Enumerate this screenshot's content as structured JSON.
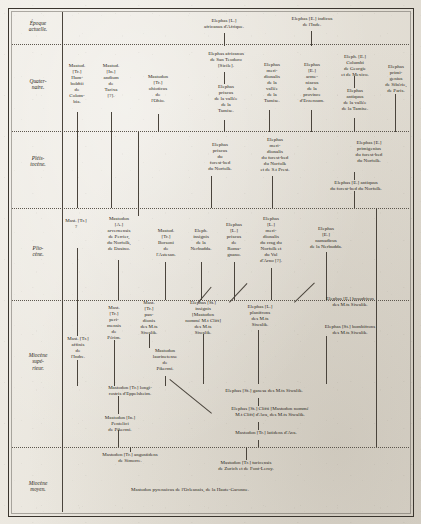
{
  "figure": {
    "language": "fr",
    "ink_color": "#2b2720",
    "paper_color": "#e8e5de"
  },
  "eras": [
    {
      "id": "epoque-actuelle",
      "label": "Époque\nactuelle."
    },
    {
      "id": "quaternaire",
      "label": "Quater-\nnaire."
    },
    {
      "id": "pleistocene",
      "label": "Pléis-\ntocène."
    },
    {
      "id": "pliocene",
      "label": "Plio-\ncène."
    },
    {
      "id": "miocene-superieur",
      "label": "Miocène\nsupé-\nrieur."
    },
    {
      "id": "miocene-moyen",
      "label": "Miocène\nmoyen."
    }
  ],
  "taxa": [
    {
      "id": "t01",
      "text": "Elephas [L.]\nafricanus d'Afrique."
    },
    {
      "id": "t02",
      "text": "Elephas [E.] indicus\nde l'Inde."
    },
    {
      "id": "t03",
      "text": "Mastod.\n[Tr.]\nHum-\nboldtii\nde\nColom-\nbia."
    },
    {
      "id": "t04",
      "text": "Mastod.\n[In.]\nandium\nde\nTarixa\n[?]."
    },
    {
      "id": "t05",
      "text": "Mastodon\n[Tr.]\nohioticus\nde\nl'Ohio."
    },
    {
      "id": "t06",
      "text": "Elephas africanus\nde San Teodoro\n[Sicile]."
    },
    {
      "id": "t07",
      "text": "Elephas\npriscus\nde la vallée\nde la\nTamise."
    },
    {
      "id": "t08",
      "text": "Elephas\nmeri-\ndionalis\nde la\nvallée\nde la\nTamise."
    },
    {
      "id": "t09",
      "text": "Elephas\n[E.]\narme-\nniacus\nde la\nprovince\nd'Erzeroum."
    },
    {
      "id": "t10",
      "text": "Eleph. [E.]\nColumbi\nde Georgie\net de Mexico."
    },
    {
      "id": "t11",
      "text": "Elephas\nantiquus\nde la vallée\nde la Tamise."
    },
    {
      "id": "t12",
      "text": "Elephas\nprimi-\ngenius\nde Sibérie,\nde Paris."
    },
    {
      "id": "t13",
      "text": "Elephas\npriscus\ndu\nforest-bed\ndu Norfolk."
    },
    {
      "id": "t14",
      "text": "Elephas\nmeri-\ndionalis\ndu forest-bed\ndu Norfolk\net de S.t Prest."
    },
    {
      "id": "t15",
      "text": "Elephas [E.]\nprimigenius\ndu forest-bed\ndu Norfolk."
    },
    {
      "id": "t16",
      "text": "Elephas [E.] antiquus\ndu forest-bed du Norfolk."
    },
    {
      "id": "t17",
      "text": "Mast. [Tr.]\n?"
    },
    {
      "id": "t18",
      "text": "Mastodon\n[A.]\narvernensis\nde Perrier,\ndu Norfolk,\nde Dusino."
    },
    {
      "id": "t19",
      "text": "Mastod.\n[Tr.]\nBorsoni\nde\nl'Astesan."
    },
    {
      "id": "t20",
      "text": "Eleph.\ninsignis\nde la\nNerbudda."
    },
    {
      "id": "t21",
      "text": "Elephas\n[L.]\npriscus\nde\nRoma-\ngnano."
    },
    {
      "id": "t22",
      "text": "Elephas\n[L.]\nmeri-\ndionalis\ndu crag du\nNorfolk et\ndu Val\nd'Arno [?]."
    },
    {
      "id": "t23",
      "text": "Elephas\n[E.]\nnamadicus\nde la Nerbudda."
    },
    {
      "id": "t24",
      "text": "Mast.\n[Tr.]\nperi-\nmensis\nde\nPérim."
    },
    {
      "id": "t25",
      "text": "Mast.\n[Tr.]\npan-\ndionis\ndes M.ts\nSiwalik."
    },
    {
      "id": "t26",
      "text": "Elephas [St.]\ninsignis\n[Mastodon\nnommé M.t Clift]\ndes M.ts\nSiwalik."
    },
    {
      "id": "t27",
      "text": "Elephas [L.]\nplanifrons\ndes M.ts\nSiwalik."
    },
    {
      "id": "t28",
      "text": "Elephas [E.] hysudricus\ndes M.ts Siwalik."
    },
    {
      "id": "t29",
      "text": "Elephas [St.] bombifrons\ndes M.ts Siwalik."
    },
    {
      "id": "t30",
      "text": "Mast. [Tr.]\naffinis\nde\nl'Indre."
    },
    {
      "id": "t31",
      "text": "Mastodon\nlaurinetense\nde\nPikermi."
    },
    {
      "id": "t32",
      "text": "Mastodon [Tr.] longi-\nrostris d'Eppelsheim."
    },
    {
      "id": "t33",
      "text": "Mastodon [In.]\nPentelici\nde Pikermi."
    },
    {
      "id": "t34",
      "text": "Elephas [St.] ganesa des M.ts Siwalik."
    },
    {
      "id": "t35",
      "text": "Elephas [St.] Clifti [Mastodon nommé\nM.t Clift] d'Ava, des M.ts Siwalik."
    },
    {
      "id": "t36",
      "text": "Mastodon [Tr.] latidens d'Ava."
    },
    {
      "id": "t37",
      "text": "Mastodon [Tr.] angustidens\nde Simorre."
    },
    {
      "id": "t38",
      "text": "Mastodon [Tr.] turicensis\nde Zurich et de Font-Leroy."
    },
    {
      "id": "t39",
      "text": "Mastodon pyrenaicus de l'Orleanais, de la Haute-Garonne."
    }
  ]
}
